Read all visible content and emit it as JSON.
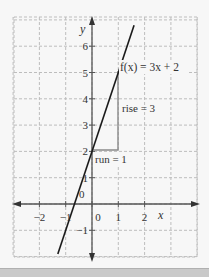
{
  "chart_data": {
    "type": "line",
    "title": "",
    "xlabel": "x",
    "ylabel": "y",
    "xlim": [
      -3.1,
      4.0
    ],
    "ylim": [
      -2.0,
      7.2
    ],
    "grid": true,
    "x_ticks": [
      "-2",
      "-1",
      "0",
      "1",
      "2"
    ],
    "y_ticks": [
      "-1",
      "0",
      "1",
      "2",
      "3",
      "4",
      "5",
      "6"
    ],
    "series": [
      {
        "name": "f(x) = 3x + 2",
        "equation": "f(x) = 3x + 2",
        "slope": 3,
        "intercept": 2,
        "x": [
          -1.3,
          1.6
        ],
        "y": [
          -1.9,
          6.8
        ]
      }
    ],
    "annotations": [
      {
        "text": "f(x) = 3x + 2",
        "x": 1.05,
        "y": 5.1
      },
      {
        "text": "rise = 3",
        "x": 1.1,
        "y": 3.3
      },
      {
        "text": "run = 1",
        "x": 0.05,
        "y": 1.55
      }
    ],
    "slope_triangle": {
      "from": [
        0,
        2
      ],
      "corner": [
        1,
        2
      ],
      "to": [
        1,
        5
      ],
      "color": "#8a8a8a"
    }
  },
  "labels": {
    "function": "f(x) = 3x + 2",
    "rise": "rise = 3",
    "run": "run = 1",
    "x_axis": "x",
    "y_axis": "y"
  },
  "colors": {
    "background": "#f7f7f7",
    "grid": "#bdbdbd",
    "axes": "#555555",
    "line": "#1a1a1a",
    "triangle": "#8a8a8a"
  }
}
